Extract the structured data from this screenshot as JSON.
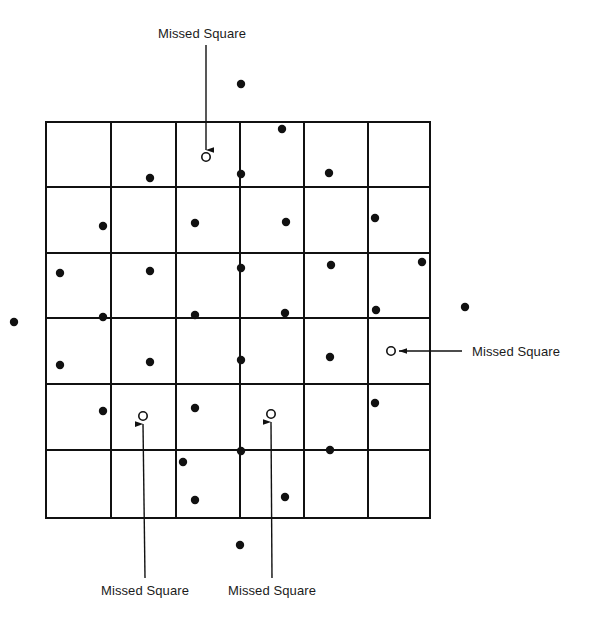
{
  "figure": {
    "title": "",
    "background_color": "#ffffff",
    "ink_color": "#111111",
    "grid": {
      "columns": 6,
      "rows": 6,
      "x_lines": [
        46,
        111,
        176,
        240,
        304,
        368,
        430
      ],
      "y_lines": [
        122,
        187,
        253,
        318,
        384,
        450,
        518
      ],
      "line_width": 2,
      "line_color": "#111111"
    },
    "markers": {
      "hit_symbol": "filled-dot",
      "hit_radius": 4.2,
      "missed_symbol": "open-circle",
      "missed_radius": 4.2,
      "missed_stroke_width": 1.6
    },
    "filled_dots": [
      {
        "x": 241,
        "y": 84
      },
      {
        "x": 282,
        "y": 129
      },
      {
        "x": 150,
        "y": 178
      },
      {
        "x": 241,
        "y": 174
      },
      {
        "x": 329,
        "y": 173
      },
      {
        "x": 103,
        "y": 226
      },
      {
        "x": 195,
        "y": 223
      },
      {
        "x": 286,
        "y": 222
      },
      {
        "x": 375,
        "y": 218
      },
      {
        "x": 60,
        "y": 273
      },
      {
        "x": 150,
        "y": 271
      },
      {
        "x": 241,
        "y": 268
      },
      {
        "x": 331,
        "y": 265
      },
      {
        "x": 422,
        "y": 262
      },
      {
        "x": 103,
        "y": 317
      },
      {
        "x": 195,
        "y": 315
      },
      {
        "x": 285,
        "y": 313
      },
      {
        "x": 376,
        "y": 310
      },
      {
        "x": 14,
        "y": 322
      },
      {
        "x": 465,
        "y": 307
      },
      {
        "x": 60,
        "y": 365
      },
      {
        "x": 150,
        "y": 362
      },
      {
        "x": 241,
        "y": 360
      },
      {
        "x": 330,
        "y": 357
      },
      {
        "x": 103,
        "y": 411
      },
      {
        "x": 195,
        "y": 408
      },
      {
        "x": 375,
        "y": 403
      },
      {
        "x": 241,
        "y": 451
      },
      {
        "x": 330,
        "y": 450
      },
      {
        "x": 183,
        "y": 462
      },
      {
        "x": 195,
        "y": 500
      },
      {
        "x": 285,
        "y": 497
      },
      {
        "x": 240,
        "y": 545
      }
    ],
    "missed_squares": [
      {
        "id": "missed-top",
        "x": 206,
        "y": 157
      },
      {
        "id": "missed-right",
        "x": 391,
        "y": 351
      },
      {
        "id": "missed-bottom-left",
        "x": 143,
        "y": 416
      },
      {
        "id": "missed-bottom-right",
        "x": 271,
        "y": 414
      }
    ],
    "callouts": [
      {
        "id": "callout-top",
        "text": "Missed Square",
        "label_x": 202,
        "label_y": 26,
        "align": "center",
        "line": {
          "x1": 206,
          "y1": 45,
          "x2": 206,
          "y2": 150
        },
        "arrow": "down"
      },
      {
        "id": "callout-right",
        "text": "Missed Square",
        "label_x": 472,
        "label_y": 344,
        "align": "left",
        "line": {
          "x1": 462,
          "y1": 351,
          "x2": 399,
          "y2": 351
        },
        "arrow": "left"
      },
      {
        "id": "callout-bottom-left",
        "text": "Missed Square",
        "label_x": 145,
        "label_y": 583,
        "align": "center",
        "line": {
          "x1": 145,
          "y1": 578,
          "x2": 143,
          "y2": 424
        },
        "arrow": "up"
      },
      {
        "id": "callout-bottom-right",
        "text": "Missed Square",
        "label_x": 272,
        "label_y": 583,
        "align": "center",
        "line": {
          "x1": 272,
          "y1": 578,
          "x2": 271,
          "y2": 422
        },
        "arrow": "up"
      }
    ]
  },
  "chart_data": {
    "type": "scatter",
    "title": "",
    "xlabel": "",
    "ylabel": "",
    "grid": true,
    "legend_position": "none",
    "annotations": [
      "Missed Square",
      "Missed Square",
      "Missed Square",
      "Missed Square"
    ],
    "series": [
      {
        "name": "Sampled point (hit)",
        "marker": "filled-dot",
        "count": 33,
        "points": [
          [
            241,
            84
          ],
          [
            282,
            129
          ],
          [
            150,
            178
          ],
          [
            241,
            174
          ],
          [
            329,
            173
          ],
          [
            103,
            226
          ],
          [
            195,
            223
          ],
          [
            286,
            222
          ],
          [
            375,
            218
          ],
          [
            60,
            273
          ],
          [
            150,
            271
          ],
          [
            241,
            268
          ],
          [
            331,
            265
          ],
          [
            422,
            262
          ],
          [
            103,
            317
          ],
          [
            195,
            315
          ],
          [
            285,
            313
          ],
          [
            376,
            310
          ],
          [
            14,
            322
          ],
          [
            465,
            307
          ],
          [
            60,
            365
          ],
          [
            150,
            362
          ],
          [
            241,
            360
          ],
          [
            330,
            357
          ],
          [
            103,
            411
          ],
          [
            195,
            408
          ],
          [
            375,
            403
          ],
          [
            241,
            451
          ],
          [
            330,
            450
          ],
          [
            183,
            462
          ],
          [
            195,
            500
          ],
          [
            285,
            497
          ],
          [
            240,
            545
          ]
        ]
      },
      {
        "name": "Missed Square",
        "marker": "open-circle",
        "count": 4,
        "points": [
          [
            206,
            157
          ],
          [
            391,
            351
          ],
          [
            143,
            416
          ],
          [
            271,
            414
          ]
        ]
      }
    ],
    "grid_cells": {
      "columns": 6,
      "rows": 6,
      "total": 36,
      "missed": 4
    }
  }
}
